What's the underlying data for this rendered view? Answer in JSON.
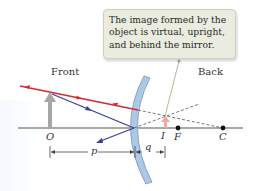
{
  "diagram": {
    "callout": {
      "lines": [
        "The image formed by the",
        "object is virtual, upright,",
        "and behind the mirror."
      ]
    },
    "regions": {
      "front": "Front",
      "back": "Back"
    },
    "points": {
      "object": "O",
      "image": "I",
      "focal": "F",
      "center": "C"
    },
    "distances": {
      "object_distance": "p",
      "image_distance": "q"
    },
    "colors": {
      "ray_red": "#d8262f",
      "ray_blue": "#3a3f9a",
      "mirror": "#a9c6e6",
      "object_arrow": "#a7a7a7",
      "image_arrow": "#f2a89a",
      "axis": "#555555",
      "callout_bg": "#e9ecdf"
    }
  }
}
